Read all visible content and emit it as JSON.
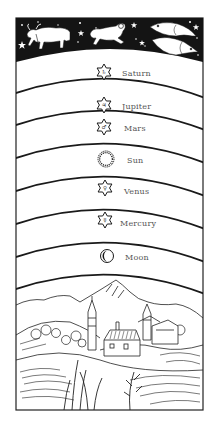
{
  "colors": {
    "ink": "#1a1a1a",
    "paper": "#ffffff",
    "label": "#555555",
    "sky": "#141414"
  },
  "zodiac": {
    "signs": [
      {
        "name": "Taurus",
        "icon": "bull-icon"
      },
      {
        "name": "Aries",
        "icon": "ram-icon"
      },
      {
        "name": "Pisces",
        "icon": "fish-icon"
      }
    ]
  },
  "spheres": [
    {
      "label": "Saturn",
      "icon": "star-icon",
      "symbol": "♄"
    },
    {
      "label": "Jupiter",
      "icon": "star-icon",
      "symbol": "♃"
    },
    {
      "label": "Mars",
      "icon": "star-icon",
      "symbol": "♂"
    },
    {
      "label": "Sun",
      "icon": "sun-icon",
      "symbol": ""
    },
    {
      "label": "Venus",
      "icon": "star-icon",
      "symbol": "♀"
    },
    {
      "label": "Mercury",
      "icon": "star-icon",
      "symbol": "☿"
    },
    {
      "label": "Moon",
      "icon": "moon-icon",
      "symbol": ""
    }
  ],
  "earth": {
    "scene": "landscape with hills, mountains, village and church towers"
  }
}
